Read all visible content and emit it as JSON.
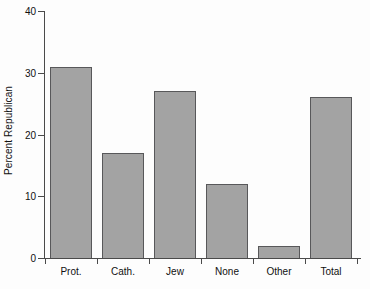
{
  "chart_data": {
    "type": "bar",
    "title": "",
    "xlabel": "",
    "ylabel": "Percent Republican",
    "categories": [
      "Prot.",
      "Cath.",
      "Jew",
      "None",
      "Other",
      "Total"
    ],
    "values": [
      31,
      17,
      27,
      12,
      2,
      26
    ],
    "ylim": [
      0,
      40
    ],
    "yticks": [
      0,
      10,
      20,
      30,
      40
    ],
    "ytick_labels": [
      "0",
      "10",
      "20",
      "30",
      "40"
    ],
    "grid": false,
    "legend": null,
    "bar_color": "#a3a3a3",
    "bar_edge_color": "#58585a",
    "background_color": "#fdfdfd",
    "axis_color": "#4a4a4a"
  }
}
